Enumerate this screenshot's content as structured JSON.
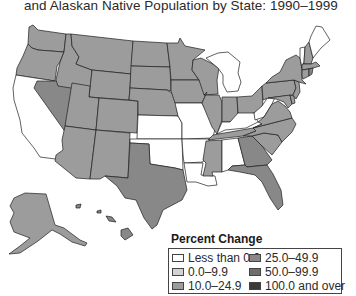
{
  "title": {
    "line2": "and Alaskan Native Population by State: 1990–1999"
  },
  "legend": {
    "title": "Percent Change",
    "items": [
      {
        "label": "Less than 0.0",
        "color": "#ffffff"
      },
      {
        "label": "0.0–9.9",
        "color": "#d2d2d2"
      },
      {
        "label": "10.0–24.9",
        "color": "#9c9c9c"
      },
      {
        "label": "25.0–49.9",
        "color": "#888888"
      },
      {
        "label": "50.0–99.9",
        "color": "#6e6e6e"
      },
      {
        "label": "100.0 and over",
        "color": "#3a3a3a"
      }
    ]
  },
  "states": {
    "WA": "10.0–24.9",
    "OR": "10.0–24.9",
    "CA": "Less than 0.0",
    "NV": "25.0–49.9",
    "ID": "10.0–24.9",
    "MT": "10.0–24.9",
    "WY": "10.0–24.9",
    "UT": "10.0–24.9",
    "AZ": "10.0–24.9",
    "CO": "10.0–24.9",
    "NM": "10.0–24.9",
    "ND": "10.0–24.9",
    "SD": "10.0–24.9",
    "NE": "10.0–24.9",
    "KS": "Less than 0.0",
    "OK": "Less than 0.0",
    "TX": "25.0–49.9",
    "MN": "10.0–24.9",
    "IA": "10.0–24.9",
    "MO": "Less than 0.0",
    "AR": "Less than 0.0",
    "LA": "Less than 0.0",
    "WI": "10.0–24.9",
    "IL": "10.0–24.9",
    "MI": "Less than 0.0",
    "IN": "10.0–24.9",
    "OH": "10.0–24.9",
    "KY": "Less than 0.0",
    "TN": "10.0–24.9",
    "MS": "10.0–24.9",
    "AL": "Less than 0.0",
    "GA": "25.0–49.9",
    "FL": "25.0–49.9",
    "SC": "10.0–24.9",
    "NC": "10.0–24.9",
    "VA": "10.0–24.9",
    "WV": "Less than 0.0",
    "PA": "10.0–24.9",
    "NY": "10.0–24.9",
    "VT": "Less than 0.0",
    "NH": "10.0–24.9",
    "ME": "Less than 0.0",
    "MA": "10.0–24.9",
    "CT": "10.0–24.9",
    "RI": "25.0–49.9",
    "NJ": "10.0–24.9",
    "DE": "10.0–24.9",
    "MD": "10.0–24.9",
    "AK": "10.0–24.9",
    "HI": "25.0–49.9"
  }
}
